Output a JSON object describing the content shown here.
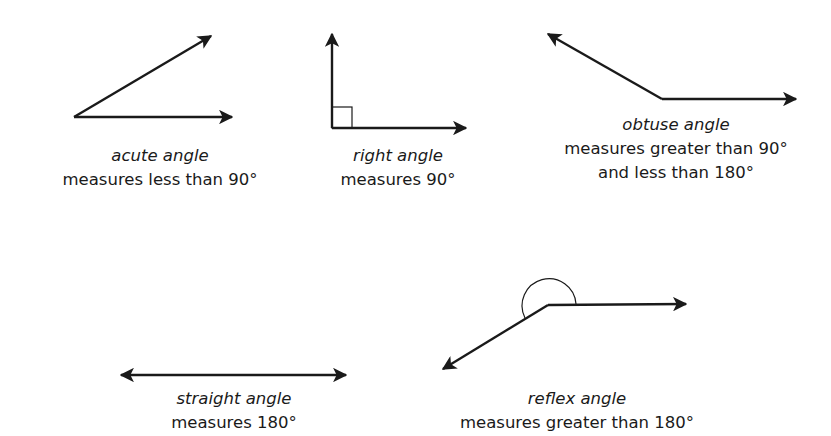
{
  "colors": {
    "background": "#ffffff",
    "stroke": "#1a1a1a",
    "text": "#1a1a1a"
  },
  "angles": [
    {
      "id": "acute",
      "name": "acute angle",
      "description": [
        "measures less than 90°"
      ],
      "vertex": [
        74,
        117
      ],
      "rays": [
        [
          212,
          35
        ],
        [
          233,
          117
        ]
      ],
      "caption_center": [
        160,
        144
      ]
    },
    {
      "id": "right",
      "name": "right angle",
      "description": [
        "measures 90°"
      ],
      "vertex": [
        332,
        128
      ],
      "rays": [
        [
          332,
          33
        ],
        [
          467,
          128
        ]
      ],
      "marker": "square",
      "caption_center": [
        398,
        144
      ]
    },
    {
      "id": "obtuse",
      "name": "obtuse angle",
      "description": [
        "measures greater than 90°",
        "and less than 180°"
      ],
      "vertex": [
        662,
        99
      ],
      "rays": [
        [
          547,
          33
        ],
        [
          797,
          99
        ]
      ],
      "caption_center": [
        676,
        113
      ]
    },
    {
      "id": "straight",
      "name": "straight angle",
      "description": [
        "measures 180°"
      ],
      "vertex": [
        233,
        375
      ],
      "rays": [
        [
          120,
          375
        ],
        [
          347,
          375
        ]
      ],
      "caption_center": [
        234,
        387
      ]
    },
    {
      "id": "reflex",
      "name": "reflex angle",
      "description": [
        "measures greater than 180°"
      ],
      "vertex": [
        548,
        305
      ],
      "rays": [
        [
          687,
          304
        ],
        [
          442,
          370
        ]
      ],
      "marker": "arc",
      "caption_center": [
        577,
        387
      ]
    }
  ]
}
